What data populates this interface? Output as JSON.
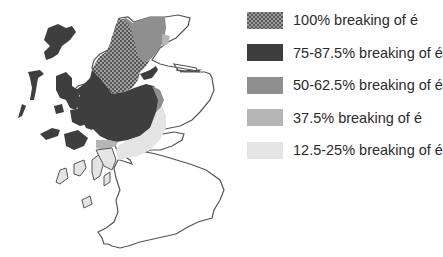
{
  "map": {
    "region": "Scotland",
    "colors": {
      "outline": "#555555",
      "land": "#ffffff",
      "level_100": "#7a7a7a",
      "level_75_87": "#3e3e3e",
      "level_50_62": "#8f8f8f",
      "level_37": "#b5b5b5",
      "level_12_25": "#e4e4e4"
    }
  },
  "legend": {
    "items": [
      {
        "label": "100% breaking of é",
        "color": "#7a7a7a",
        "pattern": "checkered"
      },
      {
        "label": "75-87.5% breaking of é",
        "color": "#3e3e3e",
        "pattern": "solid"
      },
      {
        "label": "50-62.5% breaking of é",
        "color": "#8f8f8f",
        "pattern": "solid"
      },
      {
        "label": "37.5% breaking of é",
        "color": "#b5b5b5",
        "pattern": "solid"
      },
      {
        "label": "12.5-25% breaking of é",
        "color": "#e4e4e4",
        "pattern": "solid"
      }
    ]
  }
}
